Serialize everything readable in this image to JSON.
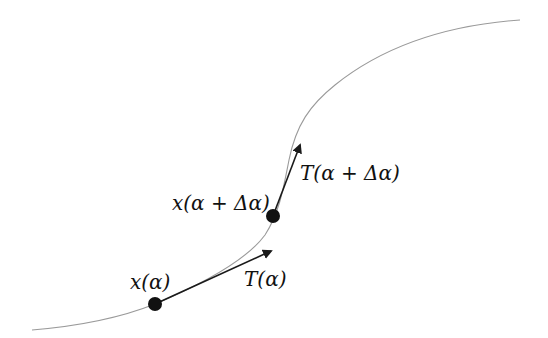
{
  "diagram": {
    "type": "tangent-vectors-on-curve",
    "colors": {
      "background": "#ffffff",
      "curve": "#9a9a9a",
      "arrow": "#1a1a1a",
      "point": "#111111",
      "text": "#111111"
    },
    "labels": {
      "point_a": "x(α)",
      "point_b": "x(α + Δα)",
      "tangent_a": "T(α)",
      "tangent_b": "T(α + Δα)"
    },
    "points": [
      {
        "id": "point_a",
        "x": 155,
        "y": 304
      },
      {
        "id": "point_b",
        "x": 273,
        "y": 216
      }
    ],
    "arrows": [
      {
        "id": "tangent_a",
        "from": [
          155,
          304
        ],
        "to": [
          271,
          251
        ]
      },
      {
        "id": "tangent_b",
        "from": [
          273,
          216
        ],
        "to": [
          300,
          145
        ]
      }
    ]
  }
}
